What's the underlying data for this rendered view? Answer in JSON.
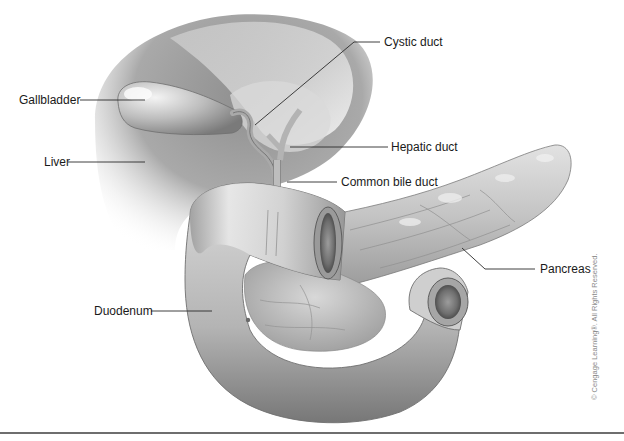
{
  "figure": {
    "type": "anatomical-illustration",
    "palette": {
      "background": "#ffffff",
      "tissue_light": "#e6e6e6",
      "tissue_mid": "#b9b9b9",
      "tissue_dark": "#7d7d7d",
      "label_text": "#1a1a1a",
      "leader_line": "#2a2a2a",
      "rule": "#6e6e6e",
      "copyright_text": "#8a8a8a"
    }
  },
  "labels": {
    "cystic_duct": "Cystic duct",
    "gallbladder": "Gallbladder",
    "hepatic_duct": "Hepatic duct",
    "liver": "Liver",
    "common_bile_duct": "Common bile duct",
    "pancreas": "Pancreas",
    "duodenum": "Duodenum"
  },
  "copyright": "© Cengage Learning®. All Rights Reserved."
}
